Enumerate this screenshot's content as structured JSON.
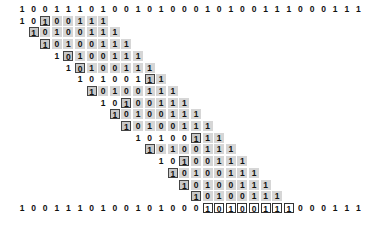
{
  "diagram": {
    "title": "",
    "text": "100111010010100010100111000111",
    "pattern": "10100111",
    "layout": {
      "x0": 22,
      "col_w": 11.6,
      "y0": 4,
      "row_h": 11.7
    },
    "rows": [
      {
        "shift": 0,
        "prefix": 2,
        "box": 2
      },
      {
        "shift": 1,
        "prefix": 0,
        "box": 0
      },
      {
        "shift": 2,
        "prefix": 0,
        "box": 0
      },
      {
        "shift": 3,
        "prefix": 1,
        "box": 1
      },
      {
        "shift": 4,
        "prefix": 1,
        "box": 1
      },
      {
        "shift": 5,
        "prefix": 6,
        "box": 6
      },
      {
        "shift": 6,
        "prefix": 0,
        "box": 0
      },
      {
        "shift": 7,
        "prefix": 2,
        "box": 2
      },
      {
        "shift": 8,
        "prefix": 0,
        "box": 0
      },
      {
        "shift": 9,
        "prefix": 0,
        "box": 0
      },
      {
        "shift": 10,
        "prefix": 5,
        "box": 5
      },
      {
        "shift": 11,
        "prefix": 0,
        "box": 0
      },
      {
        "shift": 12,
        "prefix": 2,
        "box": 2
      },
      {
        "shift": 13,
        "prefix": 0,
        "box": 0
      },
      {
        "shift": 14,
        "prefix": 0,
        "box": 0
      },
      {
        "shift": 15,
        "prefix": 0,
        "box": 0
      }
    ],
    "match": {
      "shift": 16,
      "length": 8
    },
    "colors": {
      "shaded": "#d6d6d6",
      "boxed_fill": "#c8c8c8",
      "border": "#444444"
    }
  }
}
